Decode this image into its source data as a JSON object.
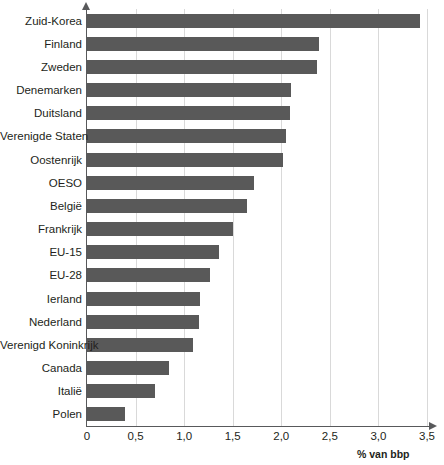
{
  "chart_data": {
    "type": "bar",
    "orientation": "horizontal",
    "title": "",
    "subtitle": "",
    "xlabel": "% van bbp",
    "ylabel": "",
    "xlim": [
      0,
      3.5
    ],
    "xticks": [
      0,
      0.5,
      1.0,
      1.5,
      2.0,
      2.5,
      3.0,
      3.5
    ],
    "xtick_labels": [
      "0",
      "0,5",
      "1,0",
      "1,5",
      "2,0",
      "2,5",
      "3,0",
      "3,5"
    ],
    "grid": "vertical",
    "legend": "none",
    "bar_color": "#595959",
    "categories": [
      "Zuid-Korea",
      "Finland",
      "Zweden",
      "Denemarken",
      "Duitsland",
      "Verenigde Staten",
      "Oostenrijk",
      "OESO",
      "België",
      "Frankrijk",
      "EU-15",
      "EU-28",
      "Ierland",
      "Nederland",
      "Verenigd Koninkrijk",
      "Canada",
      "Italië",
      "Polen"
    ],
    "values": [
      3.43,
      2.39,
      2.37,
      2.1,
      2.09,
      2.05,
      2.02,
      1.72,
      1.65,
      1.5,
      1.36,
      1.27,
      1.16,
      1.15,
      1.09,
      0.84,
      0.7,
      0.39
    ]
  }
}
